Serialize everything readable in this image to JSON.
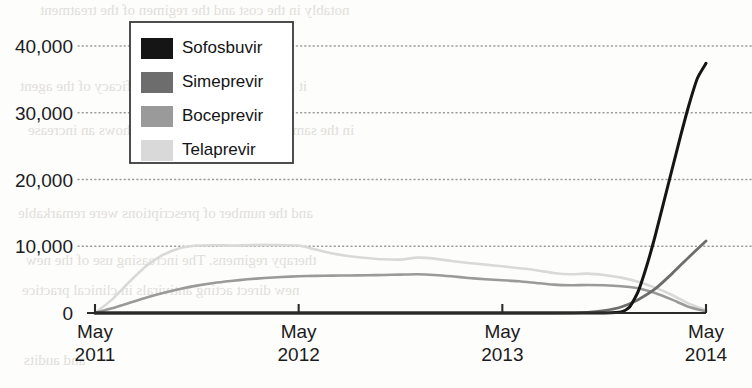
{
  "chart_data": {
    "type": "line",
    "title": "",
    "xlabel": "",
    "ylabel": "",
    "ylim": [
      0,
      42000
    ],
    "grid": true,
    "legend_position": "upper-left-inset",
    "y_ticks": [
      "0",
      "10,000",
      "20,000",
      "30,000",
      "40,000"
    ],
    "y_tick_values": [
      0,
      10000,
      20000,
      30000,
      40000
    ],
    "x_ticks": [
      {
        "month": "May",
        "year": "2011"
      },
      {
        "month": "May",
        "year": "2012"
      },
      {
        "month": "May",
        "year": "2013"
      },
      {
        "month": "May",
        "year": "2014"
      }
    ],
    "x_tick_values": [
      0,
      12,
      24,
      36
    ],
    "x_unit": "months since May 2011",
    "series": [
      {
        "name": "Sofosbuvir",
        "color": "#151515",
        "x": [
          0,
          3,
          6,
          9,
          12,
          15,
          18,
          21,
          24,
          27,
          29,
          30,
          31,
          31.5,
          32,
          32.5,
          33,
          33.5,
          34,
          34.5,
          35,
          35.5,
          36
        ],
        "values": [
          0,
          0,
          0,
          0,
          0,
          0,
          0,
          0,
          0,
          0,
          0,
          0,
          150,
          900,
          3200,
          7000,
          11500,
          16500,
          21500,
          26500,
          31200,
          35200,
          37400
        ]
      },
      {
        "name": "Simeprevir",
        "color": "#6d6d6d",
        "x": [
          0,
          3,
          6,
          9,
          12,
          15,
          18,
          21,
          24,
          27,
          29,
          30,
          31,
          32,
          33,
          34,
          35,
          36
        ],
        "values": [
          0,
          0,
          0,
          0,
          0,
          0,
          0,
          0,
          0,
          0,
          100,
          350,
          900,
          2000,
          3600,
          5900,
          8400,
          10800
        ]
      },
      {
        "name": "Boceprevir",
        "color": "#9a9a9a",
        "x": [
          0,
          1,
          2,
          3,
          4,
          5,
          6,
          7,
          8,
          9,
          10,
          11,
          12,
          13,
          14,
          15,
          16,
          17,
          18,
          19,
          20,
          21,
          22,
          23,
          24,
          25,
          26,
          27,
          28,
          29,
          30,
          31,
          32,
          33,
          34,
          35,
          36
        ],
        "values": [
          0,
          700,
          1500,
          2300,
          3000,
          3600,
          4100,
          4500,
          4800,
          5050,
          5250,
          5400,
          5500,
          5560,
          5600,
          5620,
          5650,
          5700,
          5750,
          5800,
          5700,
          5500,
          5250,
          5050,
          4900,
          4750,
          4500,
          4250,
          4150,
          4200,
          4150,
          4000,
          3700,
          3000,
          2000,
          900,
          250
        ]
      },
      {
        "name": "Telaprevir",
        "color": "#d9d9d9",
        "x": [
          0,
          1,
          2,
          3,
          4,
          5,
          6,
          7,
          8,
          9,
          10,
          11,
          12,
          13,
          14,
          15,
          16,
          17,
          18,
          19,
          20,
          21,
          22,
          23,
          24,
          25,
          26,
          27,
          28,
          29,
          30,
          31,
          32,
          33,
          34,
          35,
          36
        ],
        "values": [
          0,
          2000,
          4600,
          7000,
          8700,
          9700,
          10100,
          10150,
          10100,
          10150,
          10200,
          10150,
          10100,
          9500,
          8900,
          8500,
          8250,
          8050,
          8000,
          8300,
          8150,
          7800,
          7500,
          7250,
          7000,
          6700,
          6400,
          6000,
          5800,
          5900,
          5700,
          5300,
          4700,
          3800,
          2700,
          1400,
          400
        ]
      }
    ]
  },
  "legend": {
    "items": [
      {
        "label": "Sofosbuvir",
        "color": "#151515"
      },
      {
        "label": "Simeprevir",
        "color": "#6d6d6d"
      },
      {
        "label": "Boceprevir",
        "color": "#9a9a9a"
      },
      {
        "label": "Telaprevir",
        "color": "#d9d9d9"
      }
    ]
  },
  "ghost_text": {
    "lines": [
      "notably in the cost and the regimen of the treatment",
      "it is to be expected that the efficacy of the agent",
      "in the same period of their approval shows an increase",
      "and the number of prescriptions were remarkable",
      "therapy regimens. The increasing use of the new",
      "new direct acting antivirals in clinical practice",
      "and audits"
    ]
  }
}
